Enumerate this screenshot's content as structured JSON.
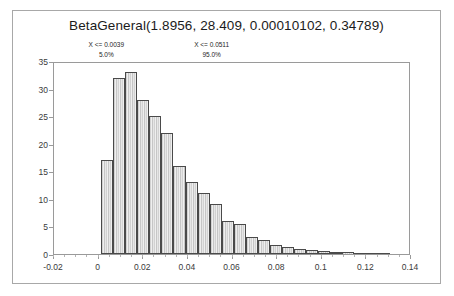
{
  "chart_data": {
    "type": "bar",
    "title": "BetaGeneral(1.8956, 28.409, 0.00010102, 0.34789)",
    "xlabel": "",
    "ylabel": "",
    "xlim": [
      -0.02,
      0.14
    ],
    "ylim": [
      0,
      35
    ],
    "grid": false,
    "legend": null,
    "bin_width": 0.0054,
    "x_ticks": [
      "-0.02",
      "0",
      "0.02",
      "0.04",
      "0.06",
      "0.08",
      "0.1",
      "0.12",
      "0.14"
    ],
    "x_tick_values": [
      -0.02,
      0,
      0.02,
      0.04,
      0.06,
      0.08,
      0.1,
      0.12,
      0.14
    ],
    "y_ticks": [
      "0",
      "5",
      "10",
      "15",
      "20",
      "25",
      "30",
      "35"
    ],
    "y_tick_values": [
      0,
      5,
      10,
      15,
      20,
      25,
      30,
      35
    ],
    "bin_left_edges": [
      0.0016,
      0.007,
      0.0124,
      0.0178,
      0.0232,
      0.0286,
      0.034,
      0.0394,
      0.0448,
      0.0502,
      0.0556,
      0.061,
      0.0664,
      0.0718,
      0.0772,
      0.0826,
      0.088,
      0.0934,
      0.0988,
      0.1042,
      0.1096,
      0.115,
      0.1204,
      0.1258
    ],
    "values": [
      17.0,
      32.0,
      33.0,
      28.0,
      25.0,
      22.0,
      16.0,
      13.0,
      11.0,
      9.0,
      6.0,
      5.5,
      3.0,
      2.5,
      1.6,
      1.3,
      0.9,
      0.7,
      0.5,
      0.4,
      0.3,
      0.25,
      0.15,
      0.1
    ],
    "annotations": [
      {
        "name": "lower-percentile",
        "x_label": "X <= 0.0039",
        "pct_label": "5.0%",
        "x_value": 0.0039,
        "percent": 5.0
      },
      {
        "name": "upper-percentile",
        "x_label": "X <= 0.0511",
        "pct_label": "95.0%",
        "x_value": 0.0511,
        "percent": 95.0
      }
    ]
  },
  "colors": {
    "frame": "#a8a8a8",
    "plot_frame": "#9a9a9a",
    "bar_fill": "#d8d8d8",
    "bar_edge": "#4a4a4a",
    "delimiter": "#b9b9b9",
    "text": "#1b1b1b",
    "background": "#ffffff"
  }
}
